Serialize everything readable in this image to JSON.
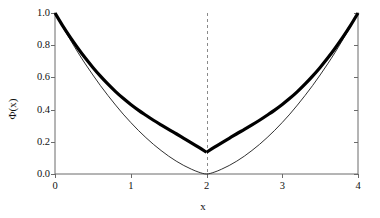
{
  "figure": {
    "background_color": "#ffffff",
    "width": 380,
    "height": 218
  },
  "axes": {
    "x_title": "x",
    "y_title": "Φ(x)",
    "x_ticks": [
      "0",
      "1",
      "2",
      "3",
      "4"
    ],
    "y_ticks": [
      "0.0",
      "0.2",
      "0.4",
      "0.6",
      "0.8",
      "1.0"
    ]
  },
  "annotations": {
    "vline_label": "x = 2"
  },
  "colors": {
    "curve_thick": "#000000",
    "curve_thin": "#1a1a1a",
    "spine": "#6b6b6b",
    "tick": "#6b6b6b",
    "dashed_line": "#8a8a8a",
    "text": "#111111"
  },
  "chart_data": {
    "type": "line",
    "title": "",
    "xlabel": "x",
    "ylabel": "Φ(x)",
    "xlim": [
      0,
      4
    ],
    "ylim": [
      0.0,
      1.0
    ],
    "xticks": [
      0,
      1,
      2,
      3,
      4
    ],
    "yticks": [
      0.0,
      0.2,
      0.4,
      0.6,
      0.8,
      1.0
    ],
    "grid": false,
    "legend": null,
    "annotations": [
      {
        "kind": "vline",
        "x": 2,
        "style": "dashed",
        "color": "#8a8a8a",
        "label": "x = 2"
      }
    ],
    "series": [
      {
        "name": "thick-curve",
        "style": "solid",
        "linewidth": 3.2,
        "color": "#000000",
        "x": [
          0.0,
          0.1,
          0.2,
          0.3,
          0.4,
          0.5,
          0.6,
          0.7,
          0.8,
          0.9,
          1.0,
          1.1,
          1.2,
          1.3,
          1.4,
          1.5,
          1.6,
          1.7,
          1.8,
          1.9,
          2.0,
          2.1,
          2.2,
          2.3,
          2.4,
          2.5,
          2.6,
          2.7,
          2.8,
          2.9,
          3.0,
          3.1,
          3.2,
          3.3,
          3.4,
          3.5,
          3.6,
          3.7,
          3.8,
          3.9,
          4.0
        ],
        "y": [
          1.0,
          0.922,
          0.85,
          0.783,
          0.72,
          0.662,
          0.608,
          0.558,
          0.512,
          0.47,
          0.432,
          0.397,
          0.365,
          0.334,
          0.305,
          0.277,
          0.25,
          0.222,
          0.194,
          0.165,
          0.135,
          0.165,
          0.194,
          0.222,
          0.25,
          0.277,
          0.305,
          0.334,
          0.365,
          0.397,
          0.432,
          0.47,
          0.512,
          0.558,
          0.608,
          0.662,
          0.72,
          0.783,
          0.85,
          0.922,
          1.0
        ]
      },
      {
        "name": "thin-curve",
        "style": "solid",
        "linewidth": 0.9,
        "color": "#1a1a1a",
        "x": [
          0.0,
          0.1,
          0.2,
          0.3,
          0.4,
          0.5,
          0.6,
          0.7,
          0.8,
          0.9,
          1.0,
          1.1,
          1.2,
          1.3,
          1.4,
          1.5,
          1.6,
          1.7,
          1.8,
          1.9,
          2.0,
          2.1,
          2.2,
          2.3,
          2.4,
          2.5,
          2.6,
          2.7,
          2.8,
          2.9,
          3.0,
          3.1,
          3.2,
          3.3,
          3.4,
          3.5,
          3.6,
          3.7,
          3.8,
          3.9,
          4.0
        ],
        "y": [
          1.0,
          0.915,
          0.835,
          0.757,
          0.684,
          0.615,
          0.549,
          0.487,
          0.428,
          0.372,
          0.32,
          0.271,
          0.226,
          0.184,
          0.146,
          0.111,
          0.08,
          0.053,
          0.03,
          0.011,
          0.0,
          0.011,
          0.03,
          0.053,
          0.08,
          0.111,
          0.146,
          0.184,
          0.226,
          0.271,
          0.32,
          0.372,
          0.428,
          0.487,
          0.549,
          0.615,
          0.684,
          0.757,
          0.835,
          0.915,
          1.0
        ]
      }
    ]
  }
}
